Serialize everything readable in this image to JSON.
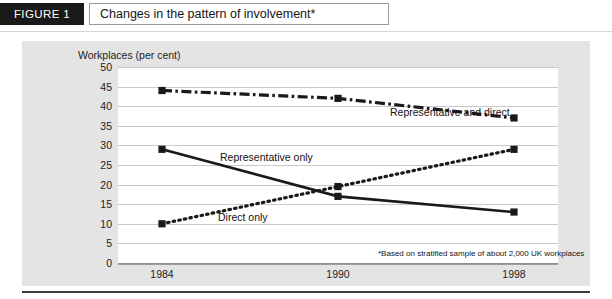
{
  "header": {
    "figure_tag": "FIGURE 1",
    "title": "Changes in the pattern of involvement*"
  },
  "chart_data": {
    "type": "line",
    "title": "Changes in the pattern of involvement*",
    "xlabel": "",
    "ylabel": "Workplaces (per cent)",
    "categories": [
      "1984",
      "1990",
      "1998"
    ],
    "x": [
      1984,
      1990,
      1998
    ],
    "ylim": [
      0,
      50
    ],
    "yticks": [
      0,
      5,
      10,
      15,
      20,
      25,
      30,
      35,
      40,
      45,
      50
    ],
    "grid": true,
    "legend_position": "inline-labels",
    "series": [
      {
        "name": "Representative and direct",
        "values": [
          44,
          42,
          37
        ],
        "style": "dash-dot",
        "color": "#1a1a1a"
      },
      {
        "name": "Representative only",
        "values": [
          29,
          17,
          13
        ],
        "style": "solid",
        "color": "#1a1a1a"
      },
      {
        "name": "Direct only",
        "values": [
          10,
          19.5,
          29
        ],
        "style": "dotted",
        "color": "#1a1a1a"
      }
    ],
    "annotations": [
      "*Based on stratified sample of about 2,000 UK workplaces"
    ]
  },
  "axis": {
    "y_title": "Workplaces (per cent)",
    "y_labels": [
      "50",
      "45",
      "40",
      "35",
      "30",
      "25",
      "20",
      "15",
      "10",
      "5",
      "0"
    ],
    "x_labels": [
      "1984",
      "1990",
      "1998"
    ]
  },
  "labels": {
    "rep_and_direct": "Representative and direct",
    "rep_only": "Representative only",
    "direct_only": "Direct only"
  },
  "footnote": {
    "text": "*Based on stratified sample of about 2,000 UK workplaces"
  },
  "colors": {
    "tag_bg": "#1a1a1a",
    "panel_bg": "#e4e4e4",
    "plot_bg": "#ffffff",
    "grid": "#c9c9c9",
    "ink": "#1a1a1a"
  }
}
